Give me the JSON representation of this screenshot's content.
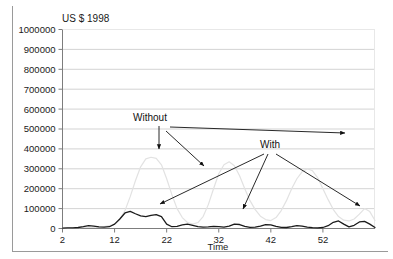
{
  "figure": {
    "background_color": "#ffffff",
    "frame_color": "#9a9a9a",
    "grid_color": "#c8c8c8"
  },
  "chart_data": {
    "type": "line",
    "title": "US $ 1998",
    "xlabel": "Time",
    "ylabel": "",
    "xlim": [
      2,
      62
    ],
    "ylim": [
      0,
      1000000
    ],
    "grid": true,
    "legend_position": "none",
    "xticks": [
      2,
      12,
      22,
      32,
      42,
      52
    ],
    "xtick_labels": [
      "2",
      "12",
      "22",
      "32",
      "42",
      "52"
    ],
    "yticks": [
      0,
      100000,
      200000,
      300000,
      400000,
      500000,
      600000,
      700000,
      800000,
      900000,
      1000000
    ],
    "ytick_labels": [
      "0",
      "100000",
      "200000",
      "300000",
      "400000",
      "500000",
      "600000",
      "700000",
      "800000",
      "900000",
      "1000000"
    ],
    "series": [
      {
        "name": "Without",
        "color": "#e2e2e2",
        "width": 1.2,
        "x": [
          2,
          4,
          6,
          8,
          10,
          12,
          13,
          14,
          15,
          16,
          17,
          18,
          19,
          20,
          21,
          22,
          23,
          24,
          25,
          26,
          27,
          28,
          29,
          30,
          31,
          32,
          33,
          34,
          35,
          36,
          37,
          38,
          39,
          40,
          41,
          42,
          43,
          44,
          45,
          46,
          47,
          48,
          49,
          50,
          51,
          52,
          53,
          54,
          55,
          56,
          57,
          58,
          59,
          60,
          61,
          62
        ],
        "values": [
          2000,
          3000,
          5000,
          6000,
          9000,
          20000,
          45000,
          90000,
          160000,
          240000,
          310000,
          350000,
          358000,
          352000,
          320000,
          250000,
          170000,
          100000,
          55000,
          30000,
          22000,
          30000,
          60000,
          120000,
          200000,
          275000,
          320000,
          335000,
          315000,
          265000,
          200000,
          140000,
          95000,
          62000,
          45000,
          40000,
          55000,
          90000,
          140000,
          200000,
          250000,
          285000,
          300000,
          290000,
          255000,
          200000,
          145000,
          95000,
          60000,
          42000,
          38000,
          48000,
          72000,
          100000,
          85000,
          40000
        ]
      },
      {
        "name": "With",
        "color": "#1a1a1a",
        "width": 1.3,
        "x": [
          2,
          3,
          4,
          5,
          6,
          7,
          8,
          9,
          10,
          11,
          12,
          13,
          14,
          15,
          16,
          17,
          18,
          19,
          20,
          21,
          22,
          23,
          24,
          25,
          26,
          27,
          28,
          29,
          30,
          31,
          32,
          33,
          34,
          35,
          36,
          37,
          38,
          39,
          40,
          41,
          42,
          43,
          44,
          45,
          46,
          47,
          48,
          49,
          50,
          51,
          52,
          53,
          54,
          55,
          56,
          57,
          58,
          59,
          60,
          61,
          62
        ],
        "values": [
          2000,
          3000,
          3000,
          5000,
          9000,
          14000,
          12000,
          8000,
          7000,
          9000,
          22000,
          48000,
          78000,
          86000,
          74000,
          63000,
          60000,
          66000,
          70000,
          60000,
          22000,
          9000,
          11000,
          18000,
          22000,
          16000,
          9000,
          7000,
          8000,
          11000,
          9000,
          7000,
          12000,
          22000,
          20000,
          11000,
          6000,
          7000,
          12000,
          19000,
          18000,
          11000,
          6000,
          5000,
          9000,
          14000,
          12000,
          7000,
          4000,
          3000,
          5000,
          14000,
          31000,
          38000,
          22000,
          8000,
          16000,
          33000,
          36000,
          22000,
          5000
        ]
      }
    ],
    "annotations": [
      {
        "label": "Without",
        "label_x": 150,
        "label_y": 121,
        "arrows": [
          {
            "x1": 159,
            "y1": 126,
            "x2": 159,
            "y2": 149
          },
          {
            "x1": 166,
            "y1": 131,
            "x2": 204,
            "y2": 166
          }
        ]
      },
      {
        "label": "With",
        "label_x": 270,
        "label_y": 148,
        "arrows": [
          {
            "x1": 264,
            "y1": 154,
            "x2": 160,
            "y2": 204
          },
          {
            "x1": 268,
            "y1": 154,
            "x2": 243,
            "y2": 209
          },
          {
            "x1": 276,
            "y1": 154,
            "x2": 360,
            "y2": 206
          }
        ]
      },
      {
        "label": "",
        "label_x": 0,
        "label_y": 0,
        "arrows": [
          {
            "x1": 170,
            "y1": 127,
            "x2": 345,
            "y2": 133
          }
        ]
      }
    ]
  }
}
